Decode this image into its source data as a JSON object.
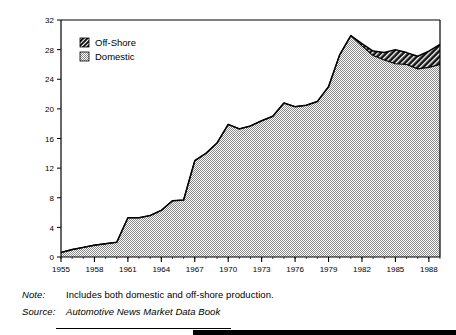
{
  "chart_data": {
    "type": "area",
    "title": "",
    "subtitle": "",
    "xlabel": "Year",
    "ylabel": "Share (%)",
    "xlim": [
      1955,
      1989
    ],
    "ylim": [
      0,
      32
    ],
    "grid": false,
    "stacked": true,
    "legend_position": "top-left",
    "legend": [
      "Off-Shore",
      "Domestic"
    ],
    "xticks": [
      1955,
      1958,
      1961,
      1964,
      1967,
      1970,
      1973,
      1976,
      1979,
      1982,
      1985,
      1988
    ],
    "xtick_labels": [
      "1955",
      "1958",
      "1961",
      "1964",
      "1967",
      "1970",
      "1973",
      "1976",
      "1979",
      "1982",
      "1985",
      "1988"
    ],
    "yticks": [
      0,
      4,
      8,
      12,
      16,
      20,
      24,
      28,
      32
    ],
    "ytick_labels": [
      "0",
      "4",
      "8",
      "12",
      "16",
      "20",
      "24",
      "28",
      "32"
    ],
    "x": [
      1955,
      1956,
      1957,
      1958,
      1959,
      1960,
      1961,
      1962,
      1963,
      1964,
      1965,
      1966,
      1967,
      1968,
      1969,
      1970,
      1971,
      1972,
      1973,
      1974,
      1975,
      1976,
      1977,
      1978,
      1979,
      1980,
      1981,
      1982,
      1983,
      1984,
      1985,
      1986,
      1987,
      1988,
      1989
    ],
    "series": [
      {
        "name": "Domestic",
        "color": "#a8a8a8",
        "pattern": "dotted-gray",
        "values": [
          0.6,
          1.0,
          1.3,
          1.6,
          1.8,
          2.0,
          5.3,
          5.3,
          5.6,
          6.3,
          7.6,
          7.7,
          13.0,
          14.0,
          15.4,
          17.9,
          17.3,
          17.7,
          18.4,
          19.0,
          20.8,
          20.3,
          20.5,
          21.0,
          23.0,
          27.3,
          29.9,
          28.5,
          27.2,
          26.6,
          26.1,
          26.0,
          25.4,
          25.6,
          26.0
        ]
      },
      {
        "name": "Off-Shore",
        "color": "#111111",
        "pattern": "diagonal-hatch",
        "values": [
          0.0,
          0.0,
          0.0,
          0.0,
          0.0,
          0.0,
          0.0,
          0.0,
          0.0,
          0.0,
          0.0,
          0.0,
          0.0,
          0.0,
          0.0,
          0.0,
          0.0,
          0.0,
          0.0,
          0.0,
          0.0,
          0.0,
          0.0,
          0.0,
          0.0,
          0.0,
          0.0,
          0.3,
          0.6,
          1.0,
          1.9,
          1.6,
          1.7,
          2.2,
          2.7
        ]
      }
    ],
    "totals": [
      0.6,
      1.0,
      1.3,
      1.6,
      1.8,
      2.0,
      5.3,
      5.3,
      5.6,
      6.3,
      7.6,
      7.7,
      13.0,
      14.0,
      15.4,
      17.9,
      17.3,
      17.7,
      18.4,
      19.0,
      20.8,
      20.3,
      20.5,
      21.0,
      23.0,
      27.3,
      29.9,
      28.8,
      27.8,
      27.6,
      28.0,
      27.6,
      27.1,
      27.8,
      28.7
    ]
  },
  "axes": {
    "ylabel": "Share (%)",
    "xlabel": "Year"
  },
  "legend": {
    "offshore_label": "Off-Shore",
    "domestic_label": "Domestic"
  },
  "footnotes": {
    "note_key": "Note:",
    "note_text": "Includes both domestic and off-shore production.",
    "source_key": "Source:",
    "source_text": "Automotive News Market Data Book"
  },
  "colors": {
    "domestic_fill": "#a8a8a8",
    "offshore_fill": "#111111",
    "axis": "#000000",
    "background": "#ffffff"
  }
}
